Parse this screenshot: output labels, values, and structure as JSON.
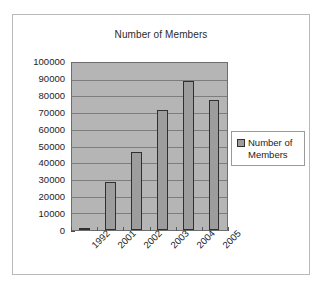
{
  "chart_data": {
    "type": "bar",
    "title": "Number of Members",
    "xlabel": "",
    "ylabel": "",
    "categories": [
      "1992",
      "2001",
      "2002",
      "2003",
      "2004",
      "2005"
    ],
    "series": [
      {
        "name": "Number of Members",
        "values": [
          500,
          29000,
          47000,
          72000,
          89000,
          78000
        ]
      }
    ],
    "ylim": [
      0,
      100000
    ],
    "ytick_labels": [
      "100000",
      "90000",
      "80000",
      "70000",
      "60000",
      "50000",
      "40000",
      "30000",
      "20000",
      "10000",
      "0"
    ],
    "ytick_values": [
      100000,
      90000,
      80000,
      70000,
      60000,
      50000,
      40000,
      30000,
      20000,
      10000,
      0
    ],
    "grid": true,
    "legend_position": "right",
    "legend_entries": [
      "Number of Members"
    ],
    "plot_background_color": "#b5b5b5",
    "bar_fill_color": "#9d9d9d",
    "bar_border_color": "#30302f",
    "gridline_color": "#7d7d7d",
    "axis_color": "#4a4a4a",
    "text_color": "#232323",
    "xtick_label_rotation": -45
  },
  "legend": {
    "label": "Number of Members",
    "swatch_name": "series-color-swatch"
  }
}
